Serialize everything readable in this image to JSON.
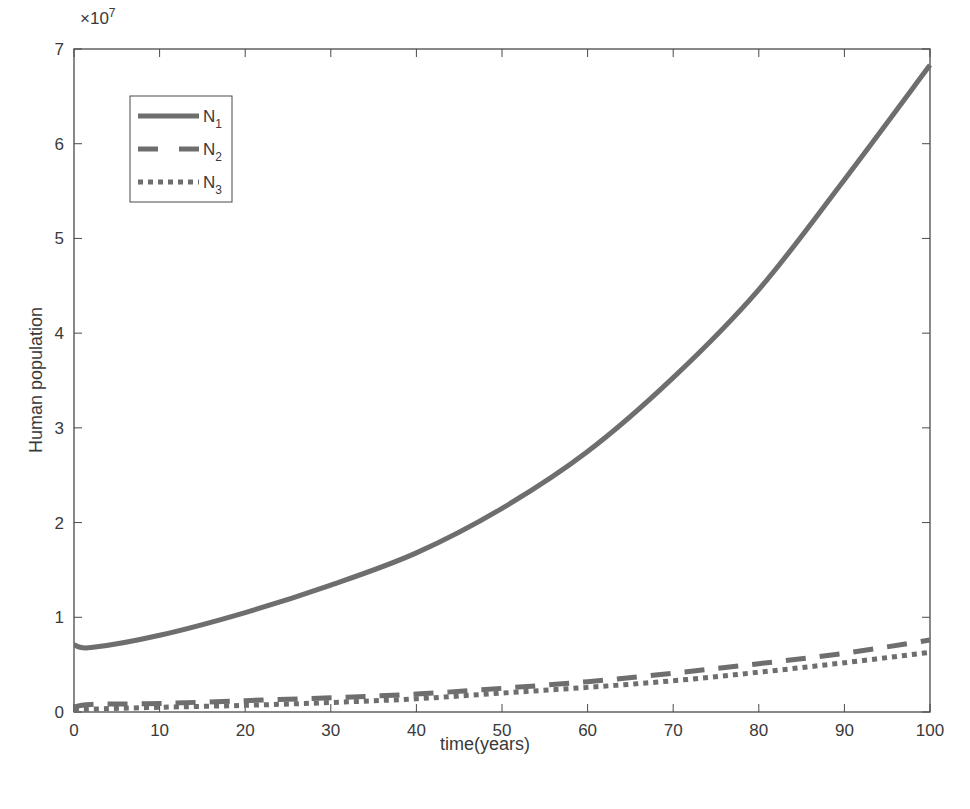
{
  "chart_data": {
    "type": "line",
    "title": "",
    "xlabel": "time(years)",
    "ylabel": "Human population",
    "y_exponent_label": "×10",
    "y_exponent": "7",
    "xlim": [
      0,
      100
    ],
    "ylim": [
      0,
      7
    ],
    "y_scale": 10000000,
    "xticks": [
      0,
      10,
      20,
      30,
      40,
      50,
      60,
      70,
      80,
      90,
      100
    ],
    "yticks": [
      0,
      1,
      2,
      3,
      4,
      5,
      6,
      7
    ],
    "grid": false,
    "legend_position": "upper left",
    "x": [
      0,
      2,
      10,
      20,
      30,
      40,
      50,
      60,
      70,
      80,
      90,
      100
    ],
    "series": [
      {
        "name": "N1",
        "label_main": "N",
        "label_sub": "1",
        "style": "solid",
        "values": [
          0.71,
          0.68,
          0.81,
          1.05,
          1.34,
          1.68,
          2.15,
          2.75,
          3.53,
          4.46,
          5.62,
          6.83
        ]
      },
      {
        "name": "N2",
        "label_main": "N",
        "label_sub": "2",
        "style": "dashed",
        "values": [
          0.05,
          0.08,
          0.09,
          0.12,
          0.15,
          0.19,
          0.25,
          0.32,
          0.41,
          0.51,
          0.62,
          0.76
        ]
      },
      {
        "name": "N3",
        "label_main": "N",
        "label_sub": "3",
        "style": "dotted",
        "values": [
          0.02,
          0.03,
          0.05,
          0.07,
          0.1,
          0.14,
          0.2,
          0.26,
          0.33,
          0.42,
          0.52,
          0.63
        ]
      }
    ]
  },
  "colors": {
    "line": "#6e6e6e",
    "axis": "#4a4a4a",
    "text": "#3a3a3a"
  }
}
